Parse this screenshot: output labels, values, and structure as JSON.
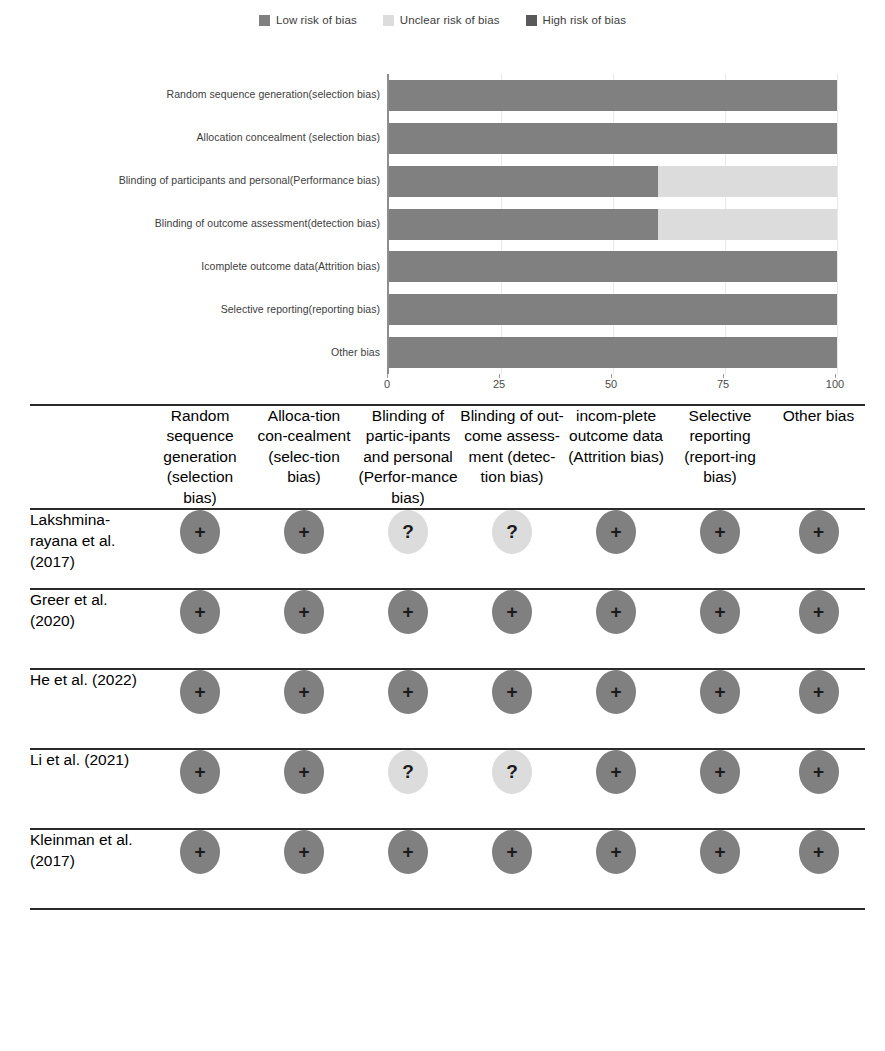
{
  "legend": {
    "items": [
      {
        "label": "Low risk of bias",
        "color": "#808080",
        "icon": "square-swatch-icon"
      },
      {
        "label": "Unclear risk of bias",
        "color": "#dcdcdc",
        "icon": "square-swatch-icon"
      },
      {
        "label": "High risk of bias",
        "color": "#595959",
        "icon": "square-swatch-icon"
      }
    ]
  },
  "chart_data": {
    "type": "bar",
    "orientation": "horizontal",
    "stacked": true,
    "title": "",
    "xlabel": "",
    "ylabel": "",
    "xlim": [
      0,
      100
    ],
    "xticks": [
      0,
      25,
      50,
      75,
      100
    ],
    "xtick_labels": [
      "0",
      "25",
      "50",
      "75",
      "100"
    ],
    "grid": true,
    "legend_position": "top-center",
    "categories": [
      "Random sequence generation(selection bias)",
      "Allocation concealment (selection bias)",
      "Blinding of participants and personal(Performance bias)",
      "Blinding of outcome assessment(detection bias)",
      "Icomplete outcome data(Attrition bias)",
      "Selective reporting(reporting bias)",
      "Other bias"
    ],
    "series": [
      {
        "name": "Low risk of bias",
        "color": "#808080",
        "values": [
          100,
          100,
          60,
          60,
          100,
          100,
          100
        ]
      },
      {
        "name": "Unclear risk of bias",
        "color": "#dcdcdc",
        "values": [
          0,
          0,
          40,
          40,
          0,
          0,
          0
        ]
      },
      {
        "name": "High risk of bias",
        "color": "#595959",
        "values": [
          0,
          0,
          0,
          0,
          0,
          0,
          0
        ]
      }
    ]
  },
  "table": {
    "study_column_header": "",
    "columns": [
      "Random sequence generation (selection bias)",
      "Alloca-tion con-cealment (selec-tion bias)",
      "Blinding of partic-ipants and personal (Perfor-mance bias)",
      "Blinding of out-come assess-ment (detec-tion bias)",
      "incom-plete outcome data (Attrition bias)",
      "Selective reporting (report-ing bias)",
      "Other bias"
    ],
    "rows": [
      {
        "study": "Lakshmina-rayana et al. (2017)",
        "judgements": [
          "low",
          "low",
          "unclear",
          "unclear",
          "low",
          "low",
          "low"
        ],
        "symbols": [
          "+",
          "+",
          "?",
          "?",
          "+",
          "+",
          "+"
        ]
      },
      {
        "study": "Greer et al. (2020)",
        "judgements": [
          "low",
          "low",
          "low",
          "low",
          "low",
          "low",
          "low"
        ],
        "symbols": [
          "+",
          "+",
          "+",
          "+",
          "+",
          "+",
          "+"
        ]
      },
      {
        "study": "He et al. (2022)",
        "judgements": [
          "low",
          "low",
          "low",
          "low",
          "low",
          "low",
          "low"
        ],
        "symbols": [
          "+",
          "+",
          "+",
          "+",
          "+",
          "+",
          "+"
        ]
      },
      {
        "study": "Li et al. (2021)",
        "judgements": [
          "low",
          "low",
          "unclear",
          "unclear",
          "low",
          "low",
          "low"
        ],
        "symbols": [
          "+",
          "+",
          "?",
          "?",
          "+",
          "+",
          "+"
        ]
      },
      {
        "study": "Kleinman et al. (2017)",
        "judgements": [
          "low",
          "low",
          "low",
          "low",
          "low",
          "low",
          "low"
        ],
        "symbols": [
          "+",
          "+",
          "+",
          "+",
          "+",
          "+",
          "+"
        ]
      }
    ]
  }
}
